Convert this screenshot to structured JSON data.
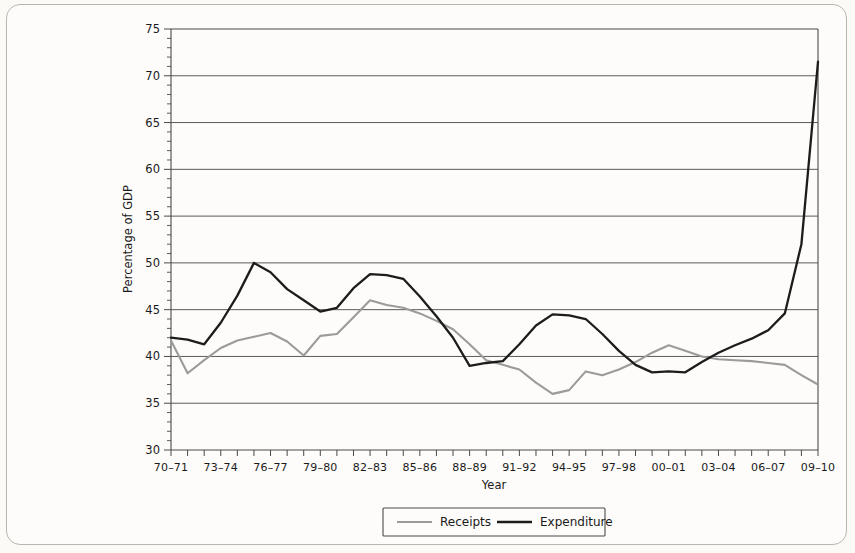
{
  "chart_data": {
    "type": "line",
    "title": "",
    "xlabel": "Year",
    "ylabel": "Percentage of GDP",
    "ylim": [
      30,
      75
    ],
    "ytick_step": 5,
    "yminor_step": 1,
    "grid": true,
    "legend_position": "bottom",
    "yticks": [
      30,
      35,
      40,
      45,
      50,
      55,
      60,
      65,
      70,
      75
    ],
    "categories": [
      "70-71",
      "71-72",
      "72-73",
      "73-74",
      "74-75",
      "75-76",
      "76-77",
      "77-78",
      "78-79",
      "79-80",
      "80-81",
      "81-82",
      "82-83",
      "83-84",
      "84-85",
      "85-86",
      "86-87",
      "87-88",
      "88-89",
      "89-90",
      "90-91",
      "91-92",
      "92-93",
      "93-94",
      "94-95",
      "95-96",
      "96-97",
      "97-98",
      "98-99",
      "99-00",
      "00-01",
      "01-02",
      "02-03",
      "03-04",
      "04-05",
      "05-06",
      "06-07",
      "07-08",
      "08-09",
      "09-10"
    ],
    "xtick_labels": [
      "70-71",
      "73-74",
      "76-77",
      "79-80",
      "82-83",
      "85-86",
      "88-89",
      "91-92",
      "94-95",
      "97-98",
      "00-01",
      "03-04",
      "06-07",
      "09-10"
    ],
    "xtick_label_every": 3,
    "series": [
      {
        "name": "Receipts",
        "color": "#9b9b9b",
        "values": [
          41.7,
          38.2,
          39.6,
          40.9,
          41.7,
          42.1,
          42.5,
          41.6,
          40.1,
          42.2,
          42.4,
          44.2,
          46.0,
          45.5,
          45.2,
          44.6,
          43.8,
          42.9,
          41.3,
          39.6,
          39.1,
          38.6,
          37.2,
          36.0,
          36.4,
          38.4,
          38.0,
          38.6,
          39.4,
          40.4,
          41.2,
          40.6,
          40.0,
          39.7,
          39.6,
          39.5,
          39.3,
          39.1,
          38.0,
          37.0
        ]
      },
      {
        "name": "Expenditure",
        "color": "#1c1c1c",
        "values": [
          42.0,
          41.8,
          41.3,
          43.6,
          46.5,
          50.0,
          49.0,
          47.2,
          46.0,
          44.8,
          45.2,
          47.3,
          48.8,
          48.7,
          48.3,
          46.4,
          44.3,
          42.0,
          39.0,
          39.3,
          39.5,
          41.3,
          43.3,
          44.5,
          44.4,
          44.0,
          42.4,
          40.6,
          39.1,
          38.3,
          38.4,
          38.3,
          39.4,
          40.4,
          41.2,
          41.9,
          42.8,
          44.6,
          52.0,
          71.5
        ]
      }
    ]
  },
  "legend": {
    "items": [
      {
        "label": "Receipts",
        "color": "#9b9b9b"
      },
      {
        "label": "Expenditure",
        "color": "#1c1c1c"
      }
    ]
  }
}
